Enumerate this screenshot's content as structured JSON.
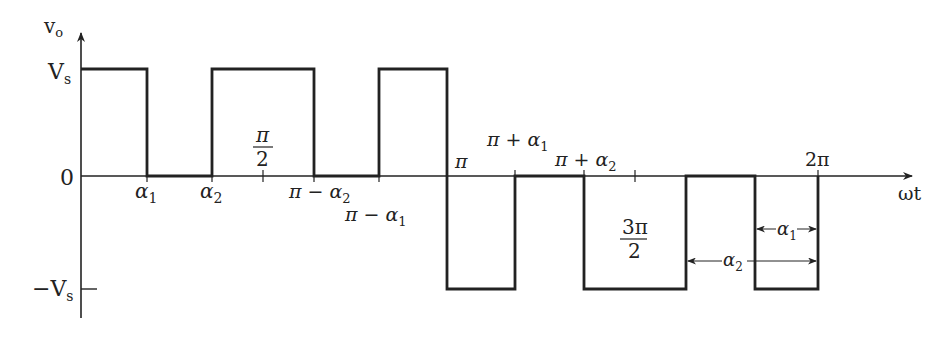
{
  "diagram": {
    "type": "waveform",
    "axes": {
      "y_label": "v",
      "y_label_sub": "o",
      "x_label": "ωt",
      "y_levels": [
        {
          "label": "V",
          "sub": "s",
          "value": 1
        },
        {
          "label": "0",
          "sub": "",
          "value": 0
        },
        {
          "label": "−V",
          "sub": "s",
          "value": -1
        }
      ]
    },
    "x_labels": {
      "alpha1": {
        "main": "α",
        "sub": "1"
      },
      "alpha2": {
        "main": "α",
        "sub": "2"
      },
      "pi_half_num": "π",
      "pi_half_den": "2",
      "pi_minus_alpha2": {
        "main": "π − α",
        "sub": "2"
      },
      "pi_minus_alpha1": {
        "main": "π − α",
        "sub": "1"
      },
      "pi": "π",
      "pi_plus_alpha1": {
        "main": "π + α",
        "sub": "1"
      },
      "pi_plus_alpha2": {
        "main": "π + α",
        "sub": "2"
      },
      "three_pi_half_num": "3π",
      "three_pi_half_den": "2",
      "two_pi": "2π"
    },
    "dimension_labels": {
      "alpha1": {
        "main": "α",
        "sub": "1"
      },
      "alpha2": {
        "main": "α",
        "sub": "2"
      }
    },
    "segments": [
      {
        "from": "0",
        "to": "α1",
        "level": "Vs"
      },
      {
        "from": "α1",
        "to": "α2",
        "level": "0"
      },
      {
        "from": "α2",
        "to": "π−α2",
        "level": "Vs"
      },
      {
        "from": "π−α2",
        "to": "π−α1",
        "level": "0"
      },
      {
        "from": "π−α1",
        "to": "π",
        "level": "Vs"
      },
      {
        "from": "π",
        "to": "π+α1",
        "level": "−Vs"
      },
      {
        "from": "π+α1",
        "to": "π+α2",
        "level": "0"
      },
      {
        "from": "π+α2",
        "to": "2π−α2",
        "level": "−Vs"
      },
      {
        "from": "2π−α2",
        "to": "2π−α1",
        "level": "0"
      },
      {
        "from": "2π−α1",
        "to": "2π",
        "level": "−Vs"
      }
    ]
  }
}
